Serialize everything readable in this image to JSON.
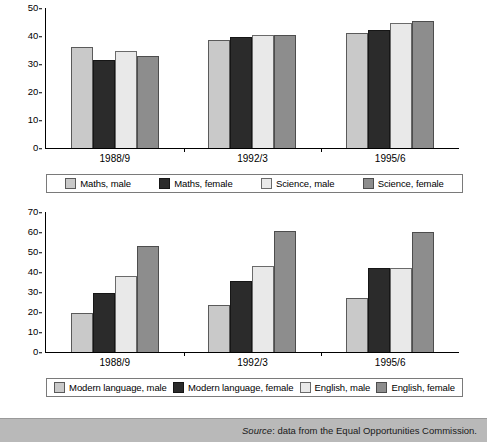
{
  "chart_data": [
    {
      "id": "maths-science",
      "type": "bar",
      "title": "",
      "xlabel": "",
      "ylabel": "",
      "categories": [
        "1988/9",
        "1992/3",
        "1995/6"
      ],
      "ylim": [
        0,
        50
      ],
      "yticks": [
        0,
        10,
        20,
        30,
        40,
        50
      ],
      "grid": false,
      "legend_position": "bottom",
      "series": [
        {
          "name": "Maths, male",
          "color": "#c9c9c9",
          "values": [
            36,
            31.5,
            38.5,
            39.5,
            41,
            42
          ]
        },
        {
          "name": "Maths, female",
          "color": "#2b2b2b",
          "values": []
        },
        {
          "name": "Science, male",
          "color": "#e9e9e9",
          "values": []
        },
        {
          "name": "Science, female",
          "color": "#8d8d8d",
          "values": []
        }
      ],
      "series_values": {
        "Maths, male": [
          36,
          38.5,
          41
        ],
        "Maths, female": [
          31.5,
          39.5,
          42
        ],
        "Science, male": [
          34.5,
          40.5,
          44.5
        ],
        "Science, female": [
          33,
          40.5,
          45.5
        ]
      }
    },
    {
      "id": "modern-language-english",
      "type": "bar",
      "title": "",
      "xlabel": "",
      "ylabel": "",
      "categories": [
        "1988/9",
        "1992/3",
        "1995/6"
      ],
      "ylim": [
        0,
        70
      ],
      "yticks": [
        0,
        10,
        20,
        30,
        40,
        50,
        60,
        70
      ],
      "grid": false,
      "legend_position": "bottom",
      "series_values": {
        "Modern language, male": [
          19.5,
          23.5,
          27
        ],
        "Modern language, female": [
          29.5,
          35.5,
          42
        ],
        "English, male": [
          38,
          43,
          42
        ],
        "English, female": [
          53,
          60.5,
          60
        ]
      }
    }
  ],
  "charts": [
    {
      "name": "top",
      "yticks": [
        "50",
        "40",
        "30",
        "20",
        "10",
        "0"
      ],
      "ymax": 50,
      "categories": [
        "1988/9",
        "1992/3",
        "1995/6"
      ],
      "series": [
        {
          "label": "Maths, male",
          "swatch": "s0",
          "values": [
            36,
            38.5,
            41
          ]
        },
        {
          "label": "Maths, female",
          "swatch": "s1",
          "values": [
            31.5,
            39.5,
            42
          ]
        },
        {
          "label": "Science, male",
          "swatch": "s2",
          "values": [
            34.5,
            40.5,
            44.5
          ]
        },
        {
          "label": "Science, female",
          "swatch": "s3",
          "values": [
            33,
            40.5,
            45.5
          ]
        }
      ]
    },
    {
      "name": "bottom",
      "yticks": [
        "70",
        "60",
        "50",
        "40",
        "30",
        "20",
        "10",
        "0"
      ],
      "ymax": 70,
      "categories": [
        "1988/9",
        "1992/3",
        "1995/6"
      ],
      "series": [
        {
          "label": "Modern language, male",
          "swatch": "s0",
          "values": [
            19.5,
            23.5,
            27
          ]
        },
        {
          "label": "Modern language, female",
          "swatch": "s1",
          "values": [
            29.5,
            35.5,
            42
          ]
        },
        {
          "label": "English, male",
          "swatch": "s2",
          "values": [
            38,
            43,
            42
          ]
        },
        {
          "label": "English, female",
          "swatch": "s3",
          "values": [
            53,
            60.5,
            60
          ]
        }
      ]
    }
  ],
  "source": {
    "label": "Source",
    "separator": ": ",
    "text": "data from the Equal Opportunities Commission."
  }
}
